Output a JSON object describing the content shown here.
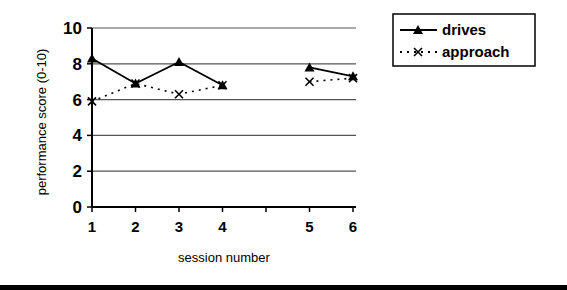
{
  "chart_data": {
    "type": "line",
    "title": "",
    "xlabel": "session number",
    "ylabel": "performance score (0-10)",
    "ylim": [
      0,
      10
    ],
    "yticks": [
      0,
      2,
      4,
      6,
      8,
      10
    ],
    "grid": true,
    "legend_position": "top-right",
    "x_tick_slots": [
      1,
      2,
      3,
      4,
      null,
      5,
      6
    ],
    "categories": [
      "1",
      "2",
      "3",
      "4",
      "5",
      "6"
    ],
    "series": [
      {
        "name": "drives",
        "style": "solid",
        "marker": "triangle",
        "values": [
          8.3,
          6.9,
          8.1,
          6.8,
          7.8,
          7.3
        ],
        "segments": [
          [
            0,
            3
          ],
          [
            4,
            5
          ]
        ]
      },
      {
        "name": "approach",
        "style": "dotted",
        "marker": "x",
        "values": [
          5.9,
          6.9,
          6.3,
          6.8,
          7.0,
          7.2
        ],
        "segments": [
          [
            0,
            3
          ],
          [
            4,
            5
          ]
        ]
      }
    ]
  },
  "legend": {
    "items": [
      {
        "label": "drives"
      },
      {
        "label": "approach"
      }
    ]
  }
}
